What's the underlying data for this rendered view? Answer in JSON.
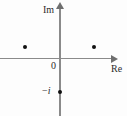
{
  "figure": {
    "kind": "complex-plane-diagram",
    "width": 127,
    "height": 116,
    "background_color": "#fdfdfd",
    "axis_color": "#8a8a8a",
    "point_color": "#111111",
    "text_color": "#2b2b2b"
  },
  "labels": {
    "imaginary_axis": "Im",
    "real_axis": "Re",
    "origin": "0",
    "minus_i_sign": "−",
    "minus_i_unit": "i",
    "minus_i_full": "−i"
  },
  "chart_data": {
    "type": "scatter",
    "title": "",
    "subtitle": "",
    "xlabel": "Re",
    "ylabel": "Im",
    "grid": false,
    "legend": null,
    "axis_style": "arrowed-cartesian-axes-through-origin",
    "xlim": [
      -1.75,
      1.45
    ],
    "ylim": [
      -1.55,
      1.45
    ],
    "tick_labels": {
      "x": [
        "0"
      ],
      "y": [
        "−i"
      ]
    },
    "origin_label": "0",
    "points": [
      {
        "label": "",
        "re": -0.9,
        "im": 0.33,
        "px": 25,
        "py": 47
      },
      {
        "label": "",
        "re": 0.88,
        "im": 0.33,
        "px": 94,
        "py": 47
      },
      {
        "label": "−i",
        "re": 0.0,
        "im": -1.0,
        "px": 60,
        "py": 92
      }
    ],
    "series": [
      {
        "name": "marked points",
        "x": [
          -0.9,
          0.88,
          0.0
        ],
        "y": [
          0.33,
          0.33,
          -1.0
        ]
      }
    ],
    "annotations": [
      {
        "text": "Im",
        "target": "imaginary-axis-arrow"
      },
      {
        "text": "Re",
        "target": "real-axis-arrow"
      },
      {
        "text": "0",
        "target": "origin"
      },
      {
        "text": "−i",
        "target": "point-on-negative-imaginary-axis"
      }
    ]
  }
}
